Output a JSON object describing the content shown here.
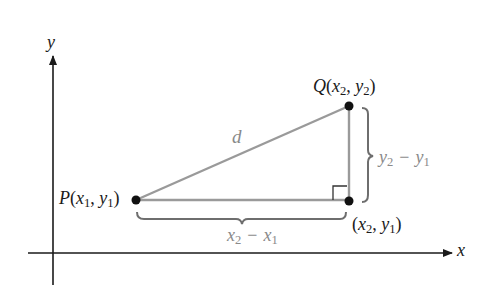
{
  "diagram": {
    "axes": {
      "x_label": "x",
      "y_label": "y"
    },
    "points": {
      "P": {
        "name": "P",
        "x_sym": "x",
        "x_sub": "1",
        "y_sym": "y",
        "y_sub": "1"
      },
      "Q": {
        "name": "Q",
        "x_sym": "x",
        "x_sub": "2",
        "y_sym": "y",
        "y_sub": "2"
      },
      "R": {
        "name": "",
        "x_sym": "x",
        "x_sub": "2",
        "y_sym": "y",
        "y_sub": "1"
      }
    },
    "hypotenuse_label": "d",
    "horizontal_leg": {
      "a": "x",
      "a_sub": "2",
      "minus": "−",
      "b": "x",
      "b_sub": "1"
    },
    "vertical_leg": {
      "a": "y",
      "a_sub": "2",
      "minus": "−",
      "b": "y",
      "b_sub": "1"
    },
    "colors": {
      "axis": "#1a1a1a",
      "triangle": "#9a9a9a",
      "bracket": "#6e6e6e",
      "point": "#111111",
      "right_angle_marker": "#333333",
      "leg_label": "#8a8a8a"
    }
  }
}
